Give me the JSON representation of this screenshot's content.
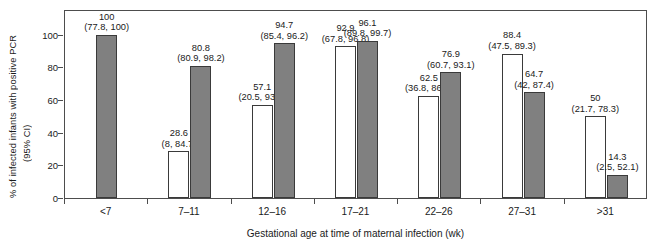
{
  "chart_data": {
    "type": "bar",
    "title": "",
    "xlabel": "Gestational age at time of maternal infection (wk)",
    "ylabel_line1": "% of infected infants with positive PCR",
    "ylabel_line2": "(95% CI)",
    "categories": [
      "<7",
      "7–11",
      "12–16",
      "17–21",
      "22–26",
      "27–31",
      ">31"
    ],
    "ylim": [
      0,
      115
    ],
    "yticks": [
      0,
      20,
      40,
      60,
      80,
      100
    ],
    "ytick_labels": [
      "0",
      "20",
      "40",
      "60",
      "80",
      "100"
    ],
    "grid": false,
    "legend": "none",
    "colors": {
      "open_bar": "#ffffff",
      "filled_bar": "#808080",
      "bar_edge": "#3a3a3a",
      "axis": "#4d4d4d",
      "text": "#1a1a1a"
    },
    "series": [
      {
        "name": "open",
        "style": "open",
        "values": [
          null,
          28.6,
          57.1,
          92.9,
          62.5,
          88.4,
          50
        ],
        "value_labels": [
          "",
          "28.6",
          "57.1",
          "92.9",
          "62.5",
          "88.4",
          "50"
        ],
        "ci_labels": [
          "",
          "(8, 84.7)",
          "(20.5, 93.8)",
          "(67.8, 96.8)",
          "(36.8, 86.2)",
          "(47.5, 89.3)",
          "(21.7, 78.3)"
        ],
        "ci_low": [
          null,
          8,
          20.5,
          67.8,
          36.8,
          47.5,
          21.7
        ],
        "ci_high": [
          null,
          84.7,
          93.8,
          96.8,
          86.2,
          89.3,
          78.3
        ]
      },
      {
        "name": "filled",
        "style": "filled",
        "values": [
          100,
          80.8,
          94.7,
          96.1,
          76.9,
          64.7,
          14.3
        ],
        "value_labels": [
          "100",
          "80.8",
          "94.7",
          "96.1",
          "76.9",
          "64.7",
          "14.3"
        ],
        "ci_labels": [
          "(77.8, 100)",
          "(80.9, 98.2)",
          "(85.4, 96.2)",
          "(89.8, 99.7)",
          "(60.7, 93.1)",
          "(42, 87.4)",
          "(2.5, 52.1)"
        ],
        "ci_low": [
          77.8,
          80.9,
          85.4,
          89.8,
          60.7,
          42,
          2.5
        ],
        "ci_high": [
          100,
          98.2,
          96.2,
          99.7,
          93.1,
          87.4,
          52.1
        ]
      }
    ]
  }
}
